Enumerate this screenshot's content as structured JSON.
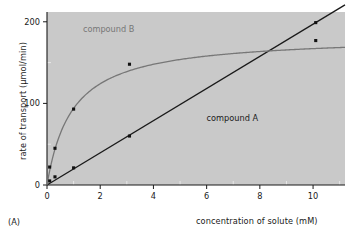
{
  "figure": {
    "panel_label": "(A)"
  },
  "chart_data": {
    "type": "line",
    "title": "",
    "xlabel": "concentration of solute (mM)",
    "ylabel": "rate of transport (µmol/min)",
    "xlim": [
      0,
      11.2
    ],
    "ylim": [
      0,
      212
    ],
    "xticks": [
      0,
      2,
      4,
      6,
      8,
      10
    ],
    "xtick_labels": [
      "0",
      "2",
      "4",
      "6",
      "8",
      "10"
    ],
    "xminor_ticks": [
      1,
      3,
      5,
      7,
      9,
      11
    ],
    "yticks": [
      0,
      100,
      200
    ],
    "ytick_labels": [
      "0",
      "100",
      "200"
    ],
    "yminor_ticks": [
      50,
      150
    ],
    "grid": false,
    "legend": "inline-annotations",
    "plot_background": "#c9c9c9",
    "page_background": "#ffffff",
    "series": [
      {
        "name": "compound A",
        "label": "compound A",
        "color": "#1a1a1a",
        "marker": "square",
        "annotation_x": 6.0,
        "annotation_y": 78,
        "behavior": "linear / non-saturating",
        "x": [
          0.1,
          0.3,
          1.0,
          3.1,
          10.1
        ],
        "y": [
          5,
          10,
          21,
          60,
          199
        ]
      },
      {
        "name": "compound B",
        "label": "compound B",
        "color": "#777777",
        "marker": "square",
        "annotation_x": 1.35,
        "annotation_y": 188,
        "behavior": "saturating (Michaelis-Menten)",
        "vmax": 183,
        "km": 0.95,
        "x": [
          0.1,
          0.3,
          1.0,
          3.1,
          10.1
        ],
        "y": [
          22,
          45,
          93,
          148,
          177
        ]
      }
    ]
  }
}
